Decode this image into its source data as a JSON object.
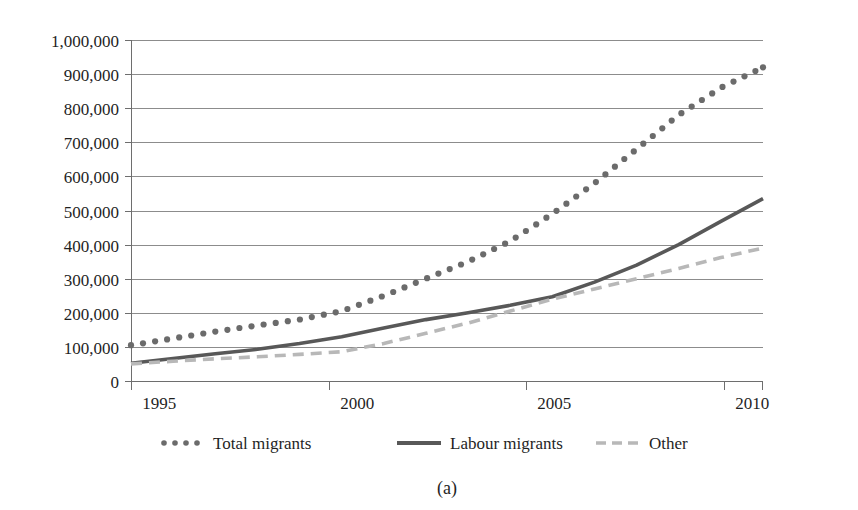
{
  "figure": {
    "caption": "(a)",
    "background_color": "#ffffff"
  },
  "chart_data": {
    "type": "line",
    "title": "",
    "subtitle": "",
    "xlabel": "",
    "ylabel": "",
    "x": [
      1995,
      1996,
      1997,
      1998,
      1999,
      2000,
      2001,
      2002,
      2003,
      2004,
      2005,
      2006,
      2007,
      2008,
      2009,
      2010
    ],
    "xlim": [
      1995,
      2010
    ],
    "ylim": [
      0,
      1000000
    ],
    "grid": true,
    "grid_axis": "y",
    "legend_position": "below",
    "xtick_labels": [
      "1995",
      "2000",
      "2005",
      "2010"
    ],
    "xtick_values": [
      1995,
      2000,
      2005,
      2010
    ],
    "ytick_labels": [
      "0",
      "100,000",
      "200,000",
      "300,000",
      "400,000",
      "500,000",
      "600,000",
      "700,000",
      "800,000",
      "900,000",
      "1,000,000"
    ],
    "ytick_values": [
      0,
      100000,
      200000,
      300000,
      400000,
      500000,
      600000,
      700000,
      800000,
      900000,
      1000000
    ],
    "series": [
      {
        "name": "Total migrants",
        "style": "dotted",
        "color": "#6b6b6b",
        "values": [
          105000,
          125000,
          145000,
          163000,
          180000,
          205000,
          250000,
          300000,
          350000,
          410000,
          490000,
          580000,
          680000,
          780000,
          860000,
          920000
        ]
      },
      {
        "name": "Labour migrants",
        "style": "solid",
        "color": "#585858",
        "values": [
          52000,
          66000,
          80000,
          93000,
          110000,
          130000,
          155000,
          180000,
          200000,
          222000,
          247000,
          290000,
          340000,
          400000,
          468000,
          535000
        ]
      },
      {
        "name": "Other",
        "style": "dashed",
        "color": "#b8b8b8",
        "values": [
          50000,
          58000,
          65000,
          71000,
          78000,
          86000,
          110000,
          140000,
          170000,
          205000,
          240000,
          270000,
          300000,
          330000,
          362000,
          390000
        ]
      }
    ]
  },
  "legend": {
    "items": [
      {
        "label": "Total migrants",
        "style": "dotted",
        "color": "#6b6b6b"
      },
      {
        "label": "Labour migrants",
        "style": "solid",
        "color": "#585858"
      },
      {
        "label": "Other",
        "style": "dashed",
        "color": "#b8b8b8"
      }
    ]
  }
}
